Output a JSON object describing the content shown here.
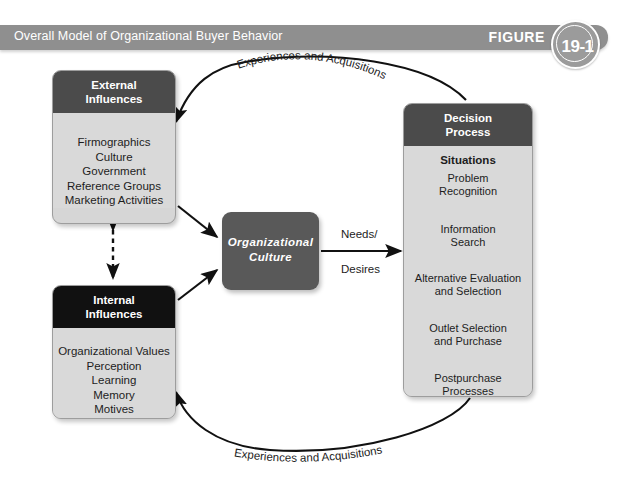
{
  "header": {
    "title": "Overall Model of Organizational Buyer Behavior",
    "figure_word": "FIGURE",
    "figure_number": "19-1",
    "banner_color": "#8f8f8f",
    "badge_color": "#9b9b9b"
  },
  "boxes": {
    "external": {
      "title_line1": "External",
      "title_line2": "Influences",
      "header_color": "#4b4b4b",
      "body_color": "#d9d9d9",
      "items": [
        "Firmographics",
        "Culture",
        "Government",
        "Reference Groups",
        "Marketing Activities"
      ]
    },
    "internal": {
      "title_line1": "Internal",
      "title_line2": "Influences",
      "header_color": "#111111",
      "body_color": "#d9d9d9",
      "items": [
        "Organizational Values",
        "Perception",
        "Learning",
        "Memory",
        "Motives",
        "Emotions"
      ]
    },
    "culture": {
      "title_line1": "Organizational",
      "title_line2": "Culture",
      "fill_color": "#595959",
      "text_color": "#ffffff"
    },
    "decision": {
      "title_line1": "Decision",
      "title_line2": "Process",
      "header_color": "#4b4b4b",
      "body_color": "#d9d9d9",
      "steps": [
        {
          "text": "Situations",
          "bold": true
        },
        {
          "text": "Problem",
          "bold": false
        },
        {
          "text": "Recognition",
          "bold": false
        },
        {
          "text": "Information",
          "bold": false
        },
        {
          "text": "Search",
          "bold": false
        },
        {
          "text": "Alternative Evaluation",
          "bold": false
        },
        {
          "text": "and Selection",
          "bold": false
        },
        {
          "text": "Outlet Selection",
          "bold": false
        },
        {
          "text": "and Purchase",
          "bold": false
        },
        {
          "text": "Postpurchase",
          "bold": false
        },
        {
          "text": "Processes",
          "bold": false
        }
      ]
    }
  },
  "connectors": {
    "needs_label": "Needs/",
    "desires_label": "Desires",
    "top_curve_label": "Experiences and Acquisitions",
    "bottom_curve_label": "Experiences and Acquisitions",
    "line_color": "#111111"
  }
}
